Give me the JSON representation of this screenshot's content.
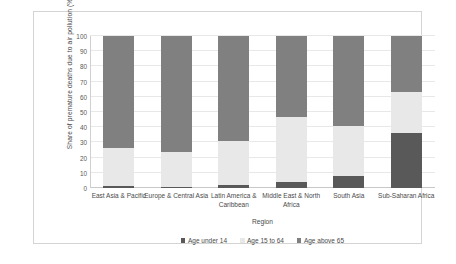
{
  "chart_data": {
    "type": "bar",
    "subtype": "stacked-100-percent",
    "title": "",
    "xlabel": "Region",
    "ylabel": "Share of premature deaths due to air pollution (%)",
    "ylim": [
      0,
      100
    ],
    "yticks": [
      0,
      10,
      20,
      30,
      40,
      50,
      60,
      70,
      80,
      90,
      100
    ],
    "grid": true,
    "legend_position": "bottom",
    "categories": [
      "East Asia & Pacific",
      "Europe & Central Asia",
      "Latin America & Caribbean",
      "Middle East & North Africa",
      "South Asia",
      "Sub-Saharan Africa"
    ],
    "series": [
      {
        "name": "Age under 14",
        "color": "#595959",
        "values": [
          1,
          0.5,
          2,
          4,
          8,
          36
        ]
      },
      {
        "name": "Age 15 to 64",
        "color": "#e8e8e8",
        "values": [
          25,
          23.5,
          29,
          42.5,
          33,
          27
        ]
      },
      {
        "name": "Age above 65",
        "color": "#808080",
        "values": [
          74,
          76,
          69,
          53.5,
          59,
          37
        ]
      }
    ],
    "cumulative_tops": [
      {
        "category": "East Asia & Pacific",
        "under14": 1,
        "through_15to64": 26,
        "total": 100
      },
      {
        "category": "Europe & Central Asia",
        "under14": 0.5,
        "through_15to64": 24,
        "total": 100
      },
      {
        "category": "Latin America & Caribbean",
        "under14": 2,
        "through_15to64": 31,
        "total": 100
      },
      {
        "category": "Middle East & North Africa",
        "under14": 4,
        "through_15to64": 46.5,
        "total": 100
      },
      {
        "category": "South Asia",
        "under14": 8,
        "through_15to64": 41,
        "total": 100
      },
      {
        "category": "Sub-Saharan Africa",
        "under14": 36,
        "through_15to64": 63,
        "total": 100
      }
    ]
  }
}
